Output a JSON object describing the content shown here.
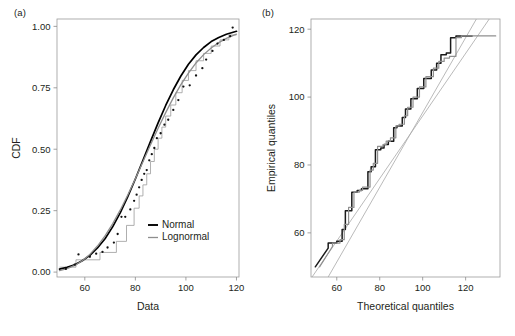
{
  "figure": {
    "panel_a_label": "(a)",
    "panel_b_label": "(b)",
    "background": "#ffffff",
    "normal_color": "#000000",
    "lognormal_color": "#8e8e8e",
    "grid_color": "#ededf1",
    "frame_color": "#9b9b9b"
  },
  "chart_data": [
    {
      "id": "panel-a",
      "type": "line",
      "title": "(a)",
      "xlabel": "Data",
      "ylabel": "CDF",
      "xlim": [
        49,
        121
      ],
      "ylim": [
        -0.02,
        1.03
      ],
      "xticks": [
        60,
        80,
        100,
        120
      ],
      "yticks": [
        0.0,
        0.25,
        0.5,
        0.75,
        1.0
      ],
      "xticklabels": [
        "60",
        "80",
        "100",
        "120"
      ],
      "yticklabels": [
        "0.00",
        "0.25",
        "0.50",
        "0.75",
        "1.00"
      ],
      "grid": true,
      "legend": {
        "position": "lower-right",
        "entries": [
          {
            "label": "Normal",
            "color": "#000000"
          },
          {
            "label": "Lognormal",
            "color": "#8e8e8e"
          }
        ]
      },
      "series": [
        {
          "name": "Normal",
          "color": "#000000",
          "x": [
            50,
            53,
            56,
            59,
            62,
            65,
            68,
            71,
            74,
            77,
            80,
            83,
            86,
            89,
            92,
            95,
            98,
            101,
            104,
            107,
            110,
            113,
            116,
            119,
            120
          ],
          "values": [
            0.012,
            0.019,
            0.03,
            0.046,
            0.068,
            0.098,
            0.136,
            0.184,
            0.241,
            0.307,
            0.379,
            0.455,
            0.532,
            0.607,
            0.678,
            0.742,
            0.798,
            0.846,
            0.884,
            0.914,
            0.938,
            0.955,
            0.968,
            0.977,
            0.98
          ]
        },
        {
          "name": "Lognormal",
          "color": "#8e8e8e",
          "x": [
            50,
            53,
            56,
            59,
            62,
            65,
            68,
            71,
            74,
            77,
            80,
            83,
            86,
            89,
            92,
            95,
            98,
            101,
            104,
            107,
            110,
            113,
            116,
            119,
            120
          ],
          "values": [
            0.006,
            0.014,
            0.027,
            0.046,
            0.072,
            0.106,
            0.147,
            0.196,
            0.252,
            0.314,
            0.38,
            0.449,
            0.518,
            0.585,
            0.649,
            0.709,
            0.763,
            0.81,
            0.851,
            0.885,
            0.912,
            0.934,
            0.951,
            0.964,
            0.968
          ]
        }
      ],
      "data_points": {
        "name": "Empirical CDF points",
        "color": "#121212",
        "x": [
          52.5,
          56.0,
          57.5,
          62.0,
          64.5,
          67.0,
          69.0,
          71.5,
          73.0,
          74.5,
          76.0,
          78.0,
          79.5,
          80.5,
          81.5,
          82.5,
          83.5,
          84.5,
          85.5,
          86.5,
          87.5,
          88.5,
          90.0,
          91.5,
          93.0,
          95.0,
          97.0,
          99.0,
          101.5,
          104.0,
          106.5,
          108.0,
          110.5,
          112.5,
          115.0,
          117.5,
          118.5
        ],
        "y": [
          0.013,
          0.03,
          0.072,
          0.062,
          0.075,
          0.082,
          0.1,
          0.12,
          0.155,
          0.225,
          0.225,
          0.255,
          0.29,
          0.315,
          0.345,
          0.375,
          0.4,
          0.415,
          0.455,
          0.48,
          0.505,
          0.545,
          0.565,
          0.6,
          0.62,
          0.66,
          0.7,
          0.755,
          0.76,
          0.8,
          0.83,
          0.865,
          0.9,
          0.93,
          0.945,
          0.96,
          0.995
        ]
      },
      "ecdf_steps": {
        "name": "Empirical CDF step function",
        "color": "#9a9a9a",
        "x": [
          50.0,
          56.5,
          56.5,
          66.0,
          66.0,
          72.5,
          72.5,
          76.5,
          76.5,
          79.5,
          79.5,
          81.5,
          81.5,
          83.0,
          83.0,
          84.5,
          84.5,
          86.0,
          86.0,
          87.5,
          87.5,
          89.0,
          89.0,
          90.5,
          90.5,
          92.0,
          92.0,
          94.0,
          94.0,
          96.0,
          96.0,
          98.5,
          98.5,
          101.0,
          101.0,
          104.0,
          104.0,
          107.0,
          107.0,
          110.0,
          110.0,
          113.5,
          113.5,
          117.0,
          117.0,
          120.0
        ],
        "y": [
          0.02,
          0.02,
          0.05,
          0.05,
          0.08,
          0.08,
          0.125,
          0.125,
          0.19,
          0.19,
          0.26,
          0.26,
          0.31,
          0.31,
          0.355,
          0.355,
          0.4,
          0.4,
          0.45,
          0.45,
          0.5,
          0.5,
          0.545,
          0.545,
          0.59,
          0.59,
          0.635,
          0.635,
          0.68,
          0.68,
          0.73,
          0.73,
          0.78,
          0.78,
          0.82,
          0.82,
          0.86,
          0.86,
          0.89,
          0.89,
          0.92,
          0.92,
          0.945,
          0.945,
          0.965,
          0.965
        ]
      }
    },
    {
      "id": "panel-b",
      "type": "line",
      "title": "(b)",
      "xlabel": "Theoretical quantiles",
      "ylabel": "Empirical quantiles",
      "xlim": [
        48,
        136
      ],
      "ylim": [
        47,
        123
      ],
      "xticks": [
        60,
        80,
        100,
        120
      ],
      "yticks": [
        60,
        80,
        100,
        120
      ],
      "xticklabels": [
        "60",
        "80",
        "100",
        "120"
      ],
      "yticklabels": [
        "60",
        "80",
        "100",
        "120"
      ],
      "grid": true,
      "series": [
        {
          "name": "Normal QQ",
          "color": "#1a1a1a",
          "x": [
            50.0,
            56.0,
            56.0,
            60.0,
            60.0,
            62.5,
            62.5,
            64.0,
            64.0,
            67.0,
            67.0,
            69.5,
            69.5,
            71.5,
            71.5,
            74.5,
            74.5,
            76.0,
            76.0,
            78.0,
            78.0,
            80.5,
            80.5,
            82.0,
            82.0,
            84.0,
            84.0,
            86.5,
            86.5,
            88.0,
            88.0,
            90.5,
            90.5,
            92.0,
            92.0,
            94.5,
            94.5,
            97.5,
            97.5,
            100.5,
            100.5,
            104.0,
            104.0,
            106.5,
            106.5,
            108.5,
            108.5,
            111.0,
            111.0,
            113.0,
            113.0,
            115.5,
            115.5,
            123.0
          ],
          "values": [
            50.0,
            55.5,
            57.0,
            57.0,
            57.5,
            57.5,
            61.0,
            61.0,
            66.5,
            66.5,
            72.0,
            72.0,
            72.5,
            72.5,
            73.0,
            73.0,
            78.0,
            78.0,
            79.5,
            79.5,
            84.5,
            84.5,
            85.0,
            85.0,
            86.0,
            86.0,
            87.0,
            87.0,
            91.0,
            91.0,
            91.5,
            91.5,
            94.0,
            94.0,
            96.5,
            96.5,
            99.5,
            99.5,
            102.5,
            102.5,
            105.5,
            105.5,
            108.0,
            108.0,
            110.0,
            110.0,
            112.5,
            112.5,
            113.0,
            113.0,
            117.5,
            117.5,
            118.0,
            118.0
          ]
        },
        {
          "name": "Lognormal QQ",
          "color": "#909090",
          "x": [
            52.0,
            58.0,
            58.0,
            61.5,
            61.5,
            63.5,
            63.5,
            65.5,
            65.5,
            68.0,
            68.0,
            70.5,
            70.5,
            72.0,
            72.0,
            75.5,
            75.5,
            77.0,
            77.0,
            79.0,
            79.0,
            81.5,
            81.5,
            83.0,
            83.0,
            85.0,
            85.0,
            87.5,
            87.5,
            89.0,
            89.0,
            91.5,
            91.5,
            93.0,
            93.0,
            95.5,
            95.5,
            98.5,
            98.5,
            101.5,
            101.5,
            105.0,
            105.0,
            107.5,
            107.5,
            110.0,
            110.0,
            112.5,
            112.5,
            115.5,
            115.5,
            118.0,
            118.0,
            134.0
          ],
          "values": [
            50.0,
            56.0,
            57.0,
            57.0,
            58.0,
            58.0,
            62.5,
            62.5,
            67.5,
            67.5,
            72.0,
            72.0,
            72.5,
            72.5,
            73.5,
            73.5,
            78.5,
            78.5,
            80.5,
            80.5,
            85.5,
            85.5,
            86.0,
            86.0,
            87.0,
            87.0,
            88.0,
            88.0,
            91.5,
            91.5,
            92.0,
            92.0,
            94.5,
            94.5,
            97.0,
            97.0,
            100.0,
            100.0,
            103.0,
            103.0,
            106.0,
            106.0,
            108.5,
            108.5,
            110.5,
            110.5,
            111.5,
            111.5,
            112.0,
            112.0,
            117.5,
            117.5,
            118.0,
            118.0
          ]
        }
      ],
      "reference_lines": [
        {
          "name": "Normal reference line",
          "color": "#a8a8a8",
          "x": [
            48.5,
            131.0
          ],
          "y": [
            47.0,
            123.0
          ]
        },
        {
          "name": "Lognormal reference line",
          "color": "#a8a8a8",
          "x": [
            56.0,
            125.0
          ],
          "y": [
            47.0,
            123.0
          ]
        }
      ]
    }
  ]
}
